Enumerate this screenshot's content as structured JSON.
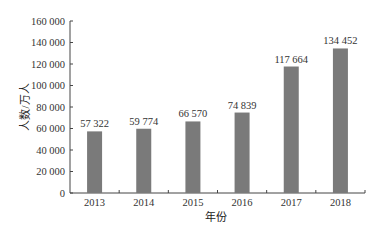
{
  "chart_data": {
    "type": "bar",
    "title": "",
    "xlabel": "年份",
    "ylabel": "人数/万人",
    "categories": [
      "2013",
      "2014",
      "2015",
      "2016",
      "2017",
      "2018"
    ],
    "values": [
      57322,
      59774,
      66570,
      74839,
      117664,
      134452
    ],
    "value_labels": [
      "57 322",
      "59 774",
      "66 570",
      "74 839",
      "117 664",
      "134 452"
    ],
    "ylim": [
      0,
      160000
    ],
    "yticks": [
      0,
      20000,
      40000,
      60000,
      80000,
      100000,
      120000,
      140000,
      160000
    ],
    "ytick_labels": [
      "0",
      "20 000",
      "40 000",
      "60 000",
      "80 000",
      "100 000",
      "120 000",
      "140 000",
      "160 000"
    ],
    "grid": false,
    "legend": null,
    "bar_color": "#7a7a7a"
  }
}
